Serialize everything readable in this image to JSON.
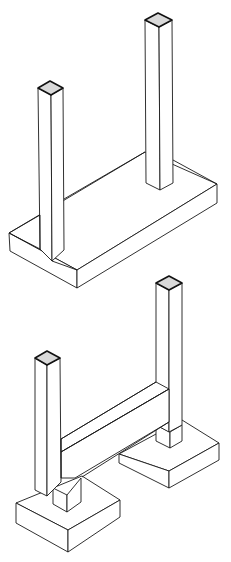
{
  "diagram": {
    "type": "isometric line drawing",
    "figures": [
      {
        "id": "top",
        "description": "Two square columns rising from a single continuous rectangular slab footing",
        "elements": [
          "left-column",
          "right-column",
          "slab-footing"
        ]
      },
      {
        "id": "bottom",
        "description": "Two square columns joined by a horizontal tie beam, each column on its own pedestal and square pad footing",
        "elements": [
          "left-column",
          "right-column",
          "tie-beam",
          "left-pad-footing",
          "right-pad-footing"
        ]
      }
    ],
    "colors": {
      "line": "#1a1a1a",
      "cap_fill": "#d9d9d9",
      "background": "#ffffff"
    }
  }
}
